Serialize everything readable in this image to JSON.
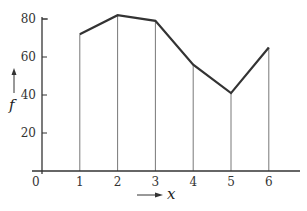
{
  "chart_data": {
    "type": "line",
    "title": "",
    "xlabel": "x",
    "ylabel": "f",
    "x": [
      1,
      2,
      3,
      4,
      5,
      6
    ],
    "values": [
      72,
      82,
      79,
      56,
      41,
      65
    ],
    "x_ticks": [
      "1",
      "2",
      "3",
      "4",
      "5",
      "6"
    ],
    "y_ticks": [
      "20",
      "40",
      "60",
      "80"
    ],
    "origin_label": "0",
    "xlim": [
      0,
      7
    ],
    "ylim": [
      0,
      80
    ],
    "grid": false,
    "drop_lines": true,
    "legend": null
  }
}
